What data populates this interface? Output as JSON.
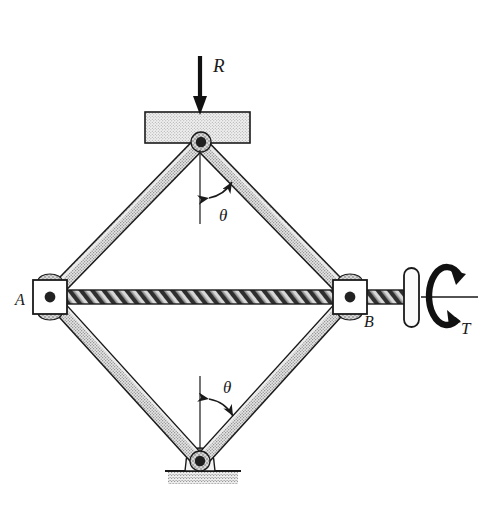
{
  "figure": {
    "width": 483,
    "height": 505,
    "background": "#ffffff"
  },
  "labels": {
    "load_force": "R",
    "torque": "T",
    "joint_a": "A",
    "joint_b": "B",
    "angle_upper": "θ",
    "angle_lower": "θ"
  },
  "colors": {
    "outline": "#1a1a1a",
    "link_fill": "#c9c9c9",
    "link_highlight": "#e8e8e8",
    "block_fill": "#dcdcdc",
    "shaft_fill": "#b8b8b8",
    "ground_fill": "#d0d0d0",
    "pin_fill": "#2b2b2b",
    "joint_body_fill": "#ffffff",
    "collar_fill": "#bdbdbd",
    "background": "#ffffff"
  },
  "geometry": {
    "pivot_top": {
      "x": 200,
      "y": 143
    },
    "pivot_bottom": {
      "x": 200,
      "y": 462
    },
    "joint_a": {
      "x": 50,
      "y": 297
    },
    "joint_b": {
      "x": 350,
      "y": 297
    },
    "link_width": 13,
    "top_block": {
      "x": 145,
      "y": 112,
      "width": 105,
      "height": 31
    },
    "ground_strip": {
      "x": 168,
      "y": 470,
      "width": 68,
      "height": 14
    },
    "shaft": {
      "x1": 50,
      "x2": 408,
      "y": 297,
      "thickness": 13
    },
    "handle": {
      "x": 404,
      "y": 268,
      "width": 14,
      "height": 58,
      "radius": 7
    },
    "torque_circle": {
      "cx": 447,
      "cy": 297,
      "rx": 18,
      "ry": 30
    },
    "center_line": {
      "x1": 418,
      "y1": 297,
      "x2": 478,
      "y2": 297
    },
    "load_arrow": {
      "x": 200,
      "y_start": 56,
      "y_end": 112
    }
  },
  "annotations": {
    "upper_angle": {
      "symbol": "θ",
      "label_x": 224,
      "label_y": 214,
      "dash_x": 200,
      "dash_y1": 150,
      "dash_y2": 222
    },
    "lower_angle": {
      "symbol": "θ",
      "label_x": 228,
      "label_y": 391,
      "dash_x": 200,
      "dash_y1": 378,
      "dash_y2": 452
    }
  },
  "text_positions": {
    "load_force": {
      "x": 213,
      "y": 70
    },
    "torque": {
      "x": 463,
      "y": 330
    },
    "joint_a": {
      "x": 18,
      "y": 303
    },
    "joint_b": {
      "x": 366,
      "y": 325
    }
  }
}
